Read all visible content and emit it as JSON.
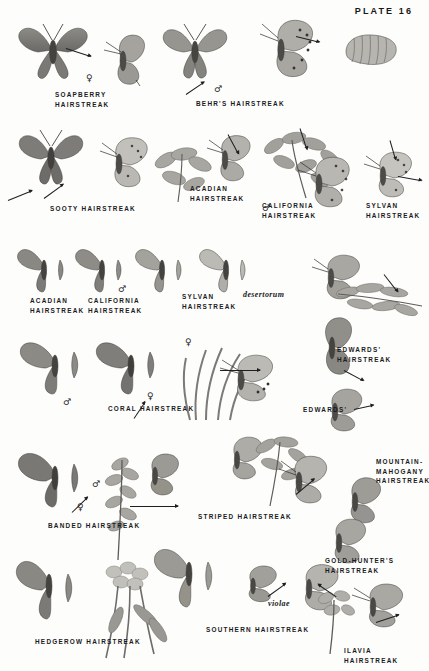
{
  "plate": {
    "title": "PLATE 16"
  },
  "symbols": {
    "male": "♂",
    "female": "♀"
  },
  "rows": [
    {
      "row": 1,
      "labels": [
        {
          "id": "soapberry-hairstreak",
          "text": "SOAPBERRY\nHAIRSTREAK",
          "x": 55,
          "y": 90
        },
        {
          "id": "behrs-hairstreak",
          "text": "BEHR'S HAIRSTREAK",
          "x": 196,
          "y": 99
        }
      ],
      "sex_marks": [
        {
          "sym": "female",
          "x": 86,
          "y": 74
        },
        {
          "sym": "male",
          "x": 214,
          "y": 87
        }
      ]
    },
    {
      "row": 2,
      "labels": [
        {
          "id": "sooty-hairstreak",
          "text": "SOOTY HAIRSTREAK",
          "x": 50,
          "y": 204
        },
        {
          "id": "acadian-hairstreak",
          "text": "ACADIAN\nHAIRSTREAK",
          "x": 190,
          "y": 184
        },
        {
          "id": "california-hairstreak",
          "text": "CALIFORNIA\nHAIRSTREAK",
          "x": 262,
          "y": 201
        },
        {
          "id": "sylvan-hairstreak",
          "text": "SYLVAN\nHAIRSTREAK",
          "x": 366,
          "y": 201
        }
      ],
      "sex_marks": [
        {
          "sym": "male",
          "x": 262,
          "y": 206
        }
      ]
    },
    {
      "row": 3,
      "labels": [
        {
          "id": "acadian-hairstreak-2",
          "text": "ACADIAN\nHAIRSTREAK",
          "x": 30,
          "y": 296
        },
        {
          "id": "california-hairstreak-2",
          "text": "CALIFORNIA\nHAIRSTREAK",
          "x": 88,
          "y": 296
        },
        {
          "id": "sylvan-hairstreak-2",
          "text": "SYLVAN\nHAIRSTREAK",
          "x": 182,
          "y": 292
        },
        {
          "id": "desertorum",
          "text": "desertorum",
          "x": 243,
          "y": 292,
          "italic": true
        }
      ],
      "sex_marks": [
        {
          "sym": "male",
          "x": 118,
          "y": 287
        }
      ]
    },
    {
      "row": 4,
      "labels": [
        {
          "id": "coral-hairstreak",
          "text": "CORAL HAIRSTREAK",
          "x": 108,
          "y": 404
        },
        {
          "id": "edwards-hairstreak",
          "text": "EDWARDS'\nHAIRSTREAK",
          "x": 337,
          "y": 345
        },
        {
          "id": "edwards",
          "text": "EDWARDS'",
          "x": 303,
          "y": 405
        }
      ],
      "sex_marks": [
        {
          "sym": "female",
          "x": 185,
          "y": 340
        },
        {
          "sym": "male",
          "x": 63,
          "y": 400
        },
        {
          "sym": "female",
          "x": 147,
          "y": 394
        }
      ]
    },
    {
      "row": 5,
      "labels": [
        {
          "id": "banded-hairstreak",
          "text": "BANDED HAIRSTREAK",
          "x": 48,
          "y": 521
        },
        {
          "id": "striped-hairstreak",
          "text": "STRIPED HAIRSTREAK",
          "x": 198,
          "y": 512
        },
        {
          "id": "mountain-mahogany-hairstreak",
          "text": "MOUNTAIN-\nMAHOGANY\nHAIRSTREAK",
          "x": 376,
          "y": 457
        }
      ],
      "sex_marks": [
        {
          "sym": "male",
          "x": 92,
          "y": 482
        },
        {
          "sym": "female",
          "x": 77,
          "y": 505
        }
      ]
    },
    {
      "row": 6,
      "labels": [
        {
          "id": "gold-hunters-hairstreak",
          "text": "GOLD-HUNTER'S\nHAIRSTREAK",
          "x": 325,
          "y": 556
        },
        {
          "id": "hedgerow-hairstreak",
          "text": "HEDGEROW HAIRSTREAK",
          "x": 35,
          "y": 637
        },
        {
          "id": "southern-hairstreak",
          "text": "SOUTHERN HAIRSTREAK",
          "x": 206,
          "y": 625
        },
        {
          "id": "ilavia-hairstreak",
          "text": "ILAVIA HAIRSTREAK",
          "x": 344,
          "y": 646
        },
        {
          "id": "violae",
          "text": "violae",
          "x": 268,
          "y": 601,
          "italic": true
        }
      ],
      "sex_marks": []
    }
  ],
  "colors": {
    "ink": "#1b1b1d",
    "paper": "#fdfdfc",
    "wing_light": "#b9b7b2",
    "wing_mid": "#8e8c87",
    "wing_dark": "#5d5b58",
    "foliage": "#9a9893"
  }
}
